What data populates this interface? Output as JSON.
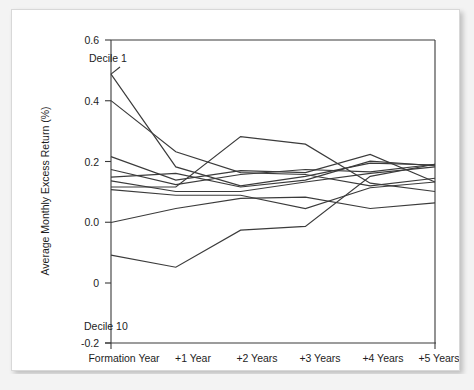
{
  "figure": {
    "background_color": "#f3f3f3",
    "card_color": "#ffffff",
    "border_color": "#d8d8d8",
    "line_color": "#3b3b3b",
    "axis_color": "#3a3a3a"
  },
  "chart_data": {
    "type": "line",
    "title": "",
    "xlabel": "",
    "ylabel": "Average Monthly Excess Return (%)",
    "categories": [
      "Formation Year",
      "+1 Year",
      "+2 Years",
      "+3 Years",
      "+4 Years",
      "+5 Years"
    ],
    "x": [
      0,
      1,
      2,
      3,
      4,
      5
    ],
    "ylim": [
      -0.2,
      0.6
    ],
    "yticks": [
      -0.2,
      -0.1,
      0.0,
      0.2,
      0.4,
      0.6
    ],
    "ytick_labels": [
      "-0.2",
      "0",
      "0.0",
      "0.2",
      "0.4",
      "0.6"
    ],
    "grid": false,
    "legend": "none",
    "annotations": [
      {
        "text": "Decile 1",
        "x": 0.05,
        "y": 0.555
      },
      {
        "text": "Decile 10",
        "x": 0.02,
        "y": -0.145
      }
    ],
    "series": [
      {
        "name": "Decile 1",
        "values": [
          0.51,
          0.265,
          0.215,
          0.24,
          0.275,
          0.27
        ]
      },
      {
        "name": "Decile 2",
        "values": [
          0.44,
          0.305,
          0.25,
          0.245,
          0.215,
          0.235
        ]
      },
      {
        "name": "Decile 3",
        "values": [
          0.292,
          0.23,
          0.255,
          0.25,
          0.298,
          0.225
        ]
      },
      {
        "name": "Decile 4",
        "values": [
          0.258,
          0.218,
          0.245,
          0.258,
          0.252,
          0.272
        ]
      },
      {
        "name": "Decile 5",
        "values": [
          0.238,
          0.248,
          0.212,
          0.23,
          0.28,
          0.268
        ]
      },
      {
        "name": "Decile 6",
        "values": [
          0.228,
          0.2,
          0.2,
          0.225,
          0.248,
          0.265
        ]
      },
      {
        "name": "Decile 7",
        "values": [
          0.212,
          0.212,
          0.345,
          0.325,
          0.222,
          0.2
        ]
      },
      {
        "name": "Decile 8",
        "values": [
          0.205,
          0.19,
          0.19,
          0.155,
          0.21,
          0.225
        ]
      },
      {
        "name": "Decile 9",
        "values": [
          0.118,
          0.155,
          0.182,
          0.185,
          0.155,
          0.17
        ]
      },
      {
        "name": "Decile 10",
        "values": [
          0.032,
          0.0,
          0.098,
          0.108,
          0.24,
          0.272
        ]
      }
    ]
  }
}
